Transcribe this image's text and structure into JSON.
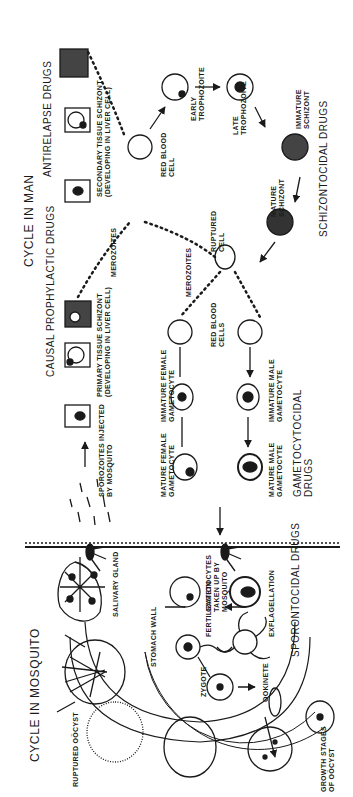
{
  "diagram": {
    "title_left": "CYCLE IN MOSQUITO",
    "title_right": "CYCLE IN MAN",
    "drug_classes": {
      "causal_prophylactic": "CAUSAL PROPHYLACTIC DRUGS",
      "antirelapse": "ANTIRELAPSE DRUGS",
      "schizontocidal": "SCHIZONTOCIDAL DRUGS",
      "gametocytocidal": "GAMETOCYTOCIDAL\nDRUGS",
      "sporontocidal": "SPORONTOCIDAL DRUGS"
    },
    "man_labels": {
      "sporozoites": "SPOROZOITES INJECTED\nBY MOSQUITO",
      "primary_schizont": "PRIMARY TISSUE SCHIZONT\n(DEVELOPING IN LIVER CELL)",
      "secondary_schizont": "SECONDARY TISSUE SCHIZONT\n(DEVELOPING IN LIVER CELL)",
      "merozoites_1": "MEROZOITES",
      "red_blood_cell": "RED BLOOD\nCELL",
      "early_trophozoite": "EARLY\nTROPHOZOITE",
      "late_trophozoite": "LATE\nTROPHOZOITE",
      "immature_schizont": "IMMATURE\nSCHIZONT",
      "mature_schizont": "MATURE\nSCHIZONT",
      "ruptured_cell": "RUPTURED\nCELL",
      "merozoites_2": "MEROZOITES",
      "red_blood_cells": "RED BLOOD\nCELLS",
      "immature_female": "IMMATURE FEMALE\nGAMETOCYTE",
      "immature_male": "IMMATURE MALE\nGAMETOCYTE",
      "mature_female": "MATURE FEMALE\nGAMETOCYTE",
      "mature_male": "MATURE MALE\nGAMETOCYTE"
    },
    "mosquito_labels": {
      "salivary_gland": "SALIVARY GLAND",
      "gametocytes_taken": "GAMETOCYTES\nTAKEN UP BY\nMOSQUITO",
      "fertilization": "FERTILIZATION",
      "exflagellation": "EXFLAGELLATION",
      "ookinete": "OOKINETE",
      "zygote": "ZYGOTE",
      "stomach_wall": "STOMACH WALL",
      "ruptured_oocyst": "RUPTURED OÖCYST",
      "growth_stages": "GROWTH STAGES\nOF OÖCYST"
    },
    "colors": {
      "ink": "#1a1a1a",
      "background": "#ffffff"
    }
  }
}
